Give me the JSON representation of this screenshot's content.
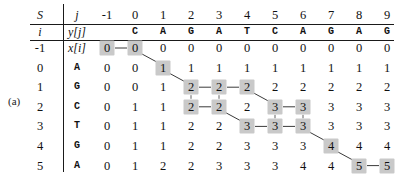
{
  "figure": {
    "label": "(a)",
    "caption_visible": false
  },
  "table": {
    "corner_label": "S",
    "col_index_header": "j",
    "row_index_header": "i",
    "row_seq_header": "x[i]",
    "col_seq_header": "y[j]",
    "col_indices": [
      "-1",
      "0",
      "1",
      "2",
      "3",
      "4",
      "5",
      "6",
      "7",
      "8",
      "9"
    ],
    "col_sequence": [
      "",
      "C",
      "A",
      "G",
      "A",
      "T",
      "C",
      "A",
      "G",
      "A",
      "G"
    ],
    "rows": [
      {
        "i": "-1",
        "x": "x[i]",
        "values": [
          "0",
          "0",
          "0",
          "0",
          "0",
          "0",
          "0",
          "0",
          "0",
          "0",
          "0"
        ]
      },
      {
        "i": "0",
        "x": "A",
        "values": [
          "0",
          "0",
          "1",
          "1",
          "1",
          "1",
          "1",
          "1",
          "1",
          "1",
          "1"
        ]
      },
      {
        "i": "1",
        "x": "G",
        "values": [
          "0",
          "0",
          "1",
          "2",
          "2",
          "2",
          "2",
          "2",
          "2",
          "2",
          "2"
        ]
      },
      {
        "i": "2",
        "x": "C",
        "values": [
          "0",
          "1",
          "1",
          "2",
          "2",
          "2",
          "3",
          "3",
          "3",
          "3",
          "3"
        ]
      },
      {
        "i": "3",
        "x": "T",
        "values": [
          "0",
          "1",
          "1",
          "2",
          "2",
          "3",
          "3",
          "3",
          "3",
          "3",
          "3"
        ]
      },
      {
        "i": "4",
        "x": "G",
        "values": [
          "0",
          "1",
          "1",
          "2",
          "2",
          "3",
          "3",
          "3",
          "4",
          "4",
          "4"
        ]
      },
      {
        "i": "5",
        "x": "A",
        "values": [
          "0",
          "1",
          "2",
          "2",
          "3",
          "3",
          "3",
          "4",
          "4",
          "5",
          "5"
        ]
      }
    ],
    "highlighted_cells": [
      [
        0,
        0
      ],
      [
        0,
        1
      ],
      [
        1,
        2
      ],
      [
        2,
        3
      ],
      [
        2,
        4
      ],
      [
        2,
        5
      ],
      [
        3,
        3
      ],
      [
        3,
        4
      ],
      [
        3,
        6
      ],
      [
        3,
        7
      ],
      [
        4,
        5
      ],
      [
        4,
        6
      ],
      [
        4,
        7
      ],
      [
        5,
        8
      ],
      [
        6,
        9
      ],
      [
        6,
        10
      ]
    ],
    "path_segments": [
      {
        "from": [
          0,
          0
        ],
        "to": [
          0,
          1
        ],
        "style": "horizontal"
      },
      {
        "from": [
          0,
          1
        ],
        "to": [
          1,
          2
        ],
        "style": "diagonal"
      },
      {
        "from": [
          1,
          2
        ],
        "to": [
          2,
          3
        ],
        "style": "diagonal"
      },
      {
        "from": [
          2,
          3
        ],
        "to": [
          2,
          4
        ],
        "style": "horizontal"
      },
      {
        "from": [
          2,
          4
        ],
        "to": [
          2,
          5
        ],
        "style": "horizontal"
      },
      {
        "from": [
          2,
          3
        ],
        "to": [
          3,
          3
        ],
        "style": "vertical"
      },
      {
        "from": [
          2,
          4
        ],
        "to": [
          3,
          4
        ],
        "style": "vertical"
      },
      {
        "from": [
          3,
          3
        ],
        "to": [
          3,
          4
        ],
        "style": "horizontal"
      },
      {
        "from": [
          2,
          5
        ],
        "to": [
          3,
          6
        ],
        "style": "diagonal"
      },
      {
        "from": [
          3,
          6
        ],
        "to": [
          3,
          7
        ],
        "style": "horizontal"
      },
      {
        "from": [
          3,
          4
        ],
        "to": [
          4,
          5
        ],
        "style": "diagonal"
      },
      {
        "from": [
          4,
          5
        ],
        "to": [
          4,
          6
        ],
        "style": "horizontal"
      },
      {
        "from": [
          4,
          6
        ],
        "to": [
          4,
          7
        ],
        "style": "horizontal"
      },
      {
        "from": [
          3,
          6
        ],
        "to": [
          4,
          6
        ],
        "style": "vertical"
      },
      {
        "from": [
          3,
          7
        ],
        "to": [
          4,
          7
        ],
        "style": "vertical"
      },
      {
        "from": [
          4,
          7
        ],
        "to": [
          5,
          8
        ],
        "style": "diagonal"
      },
      {
        "from": [
          5,
          8
        ],
        "to": [
          6,
          9
        ],
        "style": "diagonal"
      },
      {
        "from": [
          6,
          9
        ],
        "to": [
          6,
          10
        ],
        "style": "horizontal"
      }
    ]
  },
  "colors": {
    "highlight": "#c9c9c9",
    "rule": "#1a1a1a",
    "text": "#111111",
    "path": "#3a3a3a",
    "background": "#ffffff"
  }
}
